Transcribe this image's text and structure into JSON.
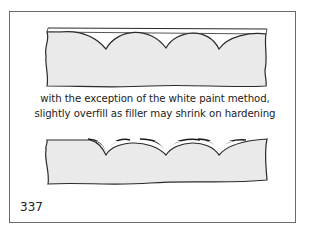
{
  "figure": {
    "caption_line_1": "with the exception of the white paint method,",
    "caption_line_2": "slightly overfill as filler may shrink on hardening",
    "page_number": "337"
  },
  "diagrams": [
    {
      "name": "top-diagram",
      "description": "cross-section with scalloped recesses, surface line above"
    },
    {
      "name": "bottom-diagram",
      "description": "cross-section with scalloped recesses slightly overfilled with filler"
    }
  ],
  "colors": {
    "fill": "#eaeaea",
    "stroke": "#2a2a2a",
    "frame": "#6a6a6a"
  }
}
